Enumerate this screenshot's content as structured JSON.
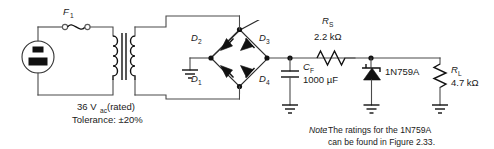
{
  "figure": {
    "type": "schematic-circuit-diagram"
  },
  "components": {
    "fuse": {
      "designator": "F",
      "subscript": "1",
      "name": "fuse-f1"
    },
    "source": {
      "name": "ac-wall-outlet-source"
    },
    "transformer": {
      "name": "transformer",
      "rating_line1": "36 V",
      "rating_sub": "ac",
      "rating_line1_tail": " (rated)",
      "rating_line2": "Tolerance: ±20%"
    },
    "diodes": [
      {
        "designator": "D",
        "subscript": "2",
        "name": "diode-d2"
      },
      {
        "designator": "D",
        "subscript": "3",
        "name": "diode-d3"
      },
      {
        "designator": "D",
        "subscript": "1",
        "name": "diode-d1"
      },
      {
        "designator": "D",
        "subscript": "4",
        "name": "diode-d4"
      }
    ],
    "series_resistor": {
      "designator": "R",
      "subscript": "S",
      "value": "2.2 kΩ",
      "name": "resistor-rs"
    },
    "filter_capacitor": {
      "designator": "C",
      "subscript": "F",
      "value": "1000 µF",
      "name": "capacitor-cf"
    },
    "zener": {
      "label": "1N759A",
      "name": "zener-diode-1n759a"
    },
    "load_resistor": {
      "designator": "R",
      "subscript": "L",
      "value": "4.7 kΩ",
      "name": "resistor-rl"
    },
    "grounds": [
      {
        "name": "ground-bridge-left"
      },
      {
        "name": "ground-capacitor"
      },
      {
        "name": "ground-zener"
      },
      {
        "name": "ground-load"
      }
    ]
  },
  "note": {
    "prefix": "Note",
    "colon": ":",
    "line1": " The ratings for the 1N759A",
    "line2": "can be found in Figure 2.33."
  },
  "colors": {
    "wire": "#4a4a4a",
    "component": "#111111",
    "background": "#ffffff",
    "text": "#1a1a1a"
  }
}
